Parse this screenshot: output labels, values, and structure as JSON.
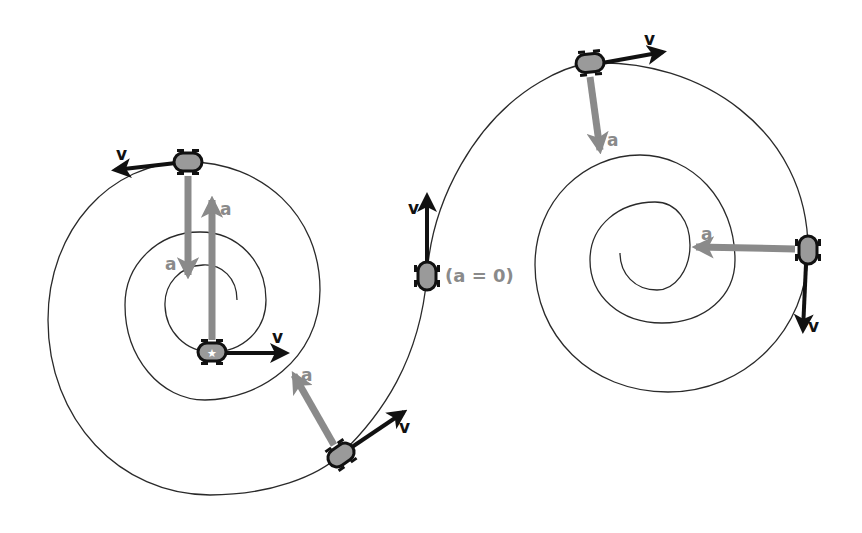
{
  "diagram": {
    "colors": {
      "path": "#2a2a2a",
      "velocity_arrow": "#111111",
      "acceleration_arrow": "#8a8a8a",
      "acceleration_label": "#8a8a8a",
      "velocity_label": "#111111",
      "car_body": "#9a9a9a",
      "car_outline": "#111111",
      "background": "#ffffff"
    },
    "labels": {
      "velocity": "v",
      "acceleration": "a",
      "zero_acceleration": "(a = 0)"
    },
    "cars": [
      {
        "id": "left-top",
        "v_label": "v",
        "a_label": "a"
      },
      {
        "id": "left-center",
        "v_label": "v",
        "a_label": "a"
      },
      {
        "id": "left-bottom",
        "v_label": "v",
        "a_label": "a"
      },
      {
        "id": "inflection",
        "v_label": "v",
        "a_label": "(a = 0)"
      },
      {
        "id": "right-top",
        "v_label": "v",
        "a_label": "a"
      },
      {
        "id": "right-side",
        "v_label": "v",
        "a_label": "a"
      }
    ]
  }
}
